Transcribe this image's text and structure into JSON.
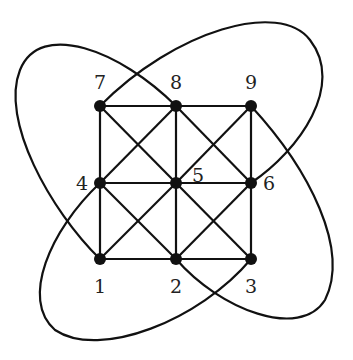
{
  "diagram": {
    "type": "graph",
    "nodes": [
      {
        "id": "1",
        "label": "1",
        "x": 100,
        "y": 259,
        "lx": 100,
        "ly": 293
      },
      {
        "id": "2",
        "label": "2",
        "x": 176,
        "y": 259,
        "lx": 176,
        "ly": 293
      },
      {
        "id": "3",
        "label": "3",
        "x": 251,
        "y": 259,
        "lx": 251,
        "ly": 293
      },
      {
        "id": "4",
        "label": "4",
        "x": 100,
        "y": 183,
        "lx": 82,
        "ly": 190
      },
      {
        "id": "5",
        "label": "5",
        "x": 176,
        "y": 183,
        "lx": 198,
        "ly": 182
      },
      {
        "id": "6",
        "label": "6",
        "x": 251,
        "y": 183,
        "lx": 269,
        "ly": 190
      },
      {
        "id": "7",
        "label": "7",
        "x": 100,
        "y": 106,
        "lx": 100,
        "ly": 89
      },
      {
        "id": "8",
        "label": "8",
        "x": 176,
        "y": 106,
        "lx": 176,
        "ly": 89
      },
      {
        "id": "9",
        "label": "9",
        "x": 251,
        "y": 106,
        "lx": 251,
        "ly": 89
      }
    ],
    "edges": [
      [
        "7",
        "8"
      ],
      [
        "8",
        "9"
      ],
      [
        "4",
        "5"
      ],
      [
        "5",
        "6"
      ],
      [
        "1",
        "2"
      ],
      [
        "2",
        "3"
      ],
      [
        "7",
        "4"
      ],
      [
        "4",
        "1"
      ],
      [
        "8",
        "5"
      ],
      [
        "5",
        "2"
      ],
      [
        "9",
        "6"
      ],
      [
        "6",
        "3"
      ],
      [
        "7",
        "5"
      ],
      [
        "5",
        "3"
      ],
      [
        "8",
        "4"
      ],
      [
        "9",
        "5"
      ],
      [
        "5",
        "1"
      ],
      [
        "8",
        "6"
      ],
      [
        "4",
        "2"
      ],
      [
        "6",
        "2"
      ]
    ],
    "loops": [
      {
        "from": "7",
        "to": "6",
        "path": "M100,106 C175,30 280,0 310,40 C345,85 300,150 251,183"
      },
      {
        "from": "8",
        "to": "1",
        "path": "M176,106 C120,50 40,20 20,70 C0,120 50,210 100,259"
      },
      {
        "from": "9",
        "to": "2",
        "path": "M251,106 C310,170 350,250 325,300 C300,340 220,310 176,259"
      },
      {
        "from": "4",
        "to": "3",
        "path": "M100,183 C50,230 20,300 55,330 C100,360 200,320 251,259"
      }
    ]
  }
}
